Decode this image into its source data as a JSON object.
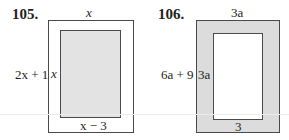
{
  "figures": [
    {
      "number": "105.",
      "outer": {
        "fill": "#ffffff",
        "width_label": "x",
        "height_label": "2x + 1"
      },
      "inner": {
        "fill": "#e3e3e3",
        "height_label": "x",
        "width_label": "x − 3"
      }
    },
    {
      "number": "106.",
      "outer": {
        "fill": "#dcdcdc",
        "width_label": "3a",
        "height_label": "6a + 9"
      },
      "inner": {
        "fill": "#ffffff",
        "height_label": "3a",
        "width_label": "3"
      }
    }
  ],
  "colors": {
    "stroke": "#4a4a4a",
    "text": "#231f20"
  }
}
